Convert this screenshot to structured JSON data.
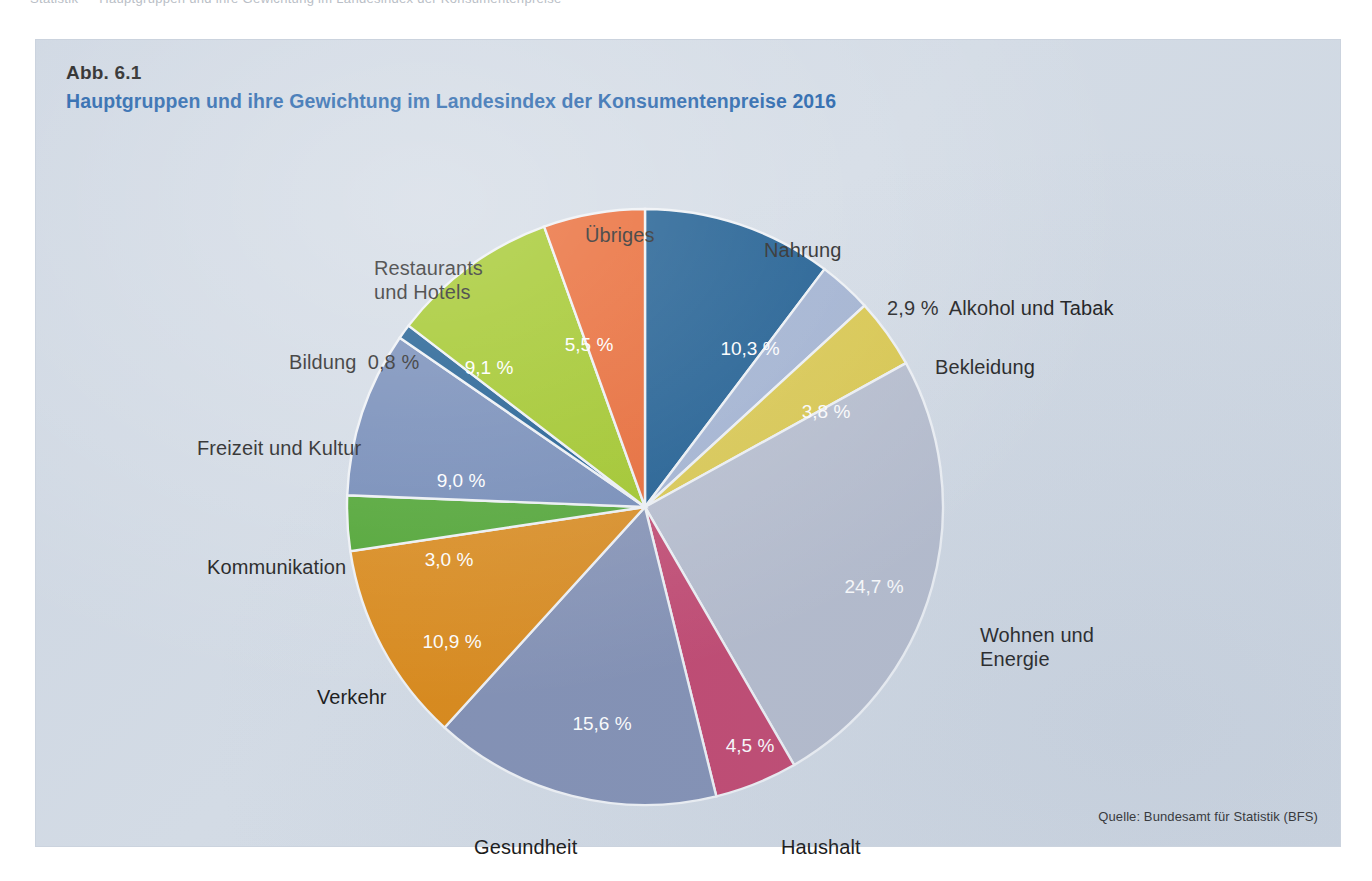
{
  "page": {
    "background_color": "#ffffff",
    "panel_color": "#ccd6e2",
    "top_artifact_text": "Statistik  — Hauptgruppen und ihre Gewichtung im Landesindex der Konsumentenpreise"
  },
  "figure": {
    "number": "Abb. 6.1",
    "title": "Hauptgruppen und ihre Gewichtung im Landesindex der Konsumentenpreise 2016",
    "title_color": "#1c5ea8",
    "source": "Quelle: Bundesamt für Statistik (BFS)"
  },
  "chart_data": {
    "type": "pie",
    "title": "Hauptgruppen und ihre Gewichtung im Landesindex der Konsumentenpreise 2016",
    "unit": "%",
    "decimal_separator": ",",
    "start_angle_deg": 0,
    "direction": "clockwise",
    "legend": "none",
    "grid": false,
    "categories": [
      "Nahrung",
      "Alkohol und Tabak",
      "Bekleidung",
      "Wohnen und Energie",
      "Haushalt",
      "Gesundheit",
      "Verkehr",
      "Kommunikation",
      "Freizeit und Kultur",
      "Bildung",
      "Restaurants und Hotels",
      "Übriges"
    ],
    "values": [
      10.3,
      2.9,
      3.8,
      24.7,
      4.5,
      15.6,
      10.9,
      3.0,
      9.0,
      0.8,
      9.1,
      5.5
    ],
    "value_labels": [
      "10,3 %",
      "2,9 %",
      "3,8 %",
      "24,7 %",
      "4,5 %",
      "15,6 %",
      "10,9 %",
      "3,0 %",
      "9,0 %",
      "0,8 %",
      "9,1 %",
      "5,5 %"
    ],
    "colors": [
      "#14568c",
      "#9fb0d0",
      "#d9c647",
      "#b5bccd",
      "#c1456e",
      "#8290b4",
      "#d9891a",
      "#4ca32f",
      "#6f87b5",
      "#14568c",
      "#9dc41e",
      "#e8622a"
    ],
    "slice_label_placement": [
      "inside",
      "outside",
      "inside",
      "inside",
      "inside",
      "inside",
      "inside",
      "inside",
      "inside",
      "outside",
      "inside",
      "inside"
    ]
  },
  "outer_labels": [
    {
      "name": "uebriges",
      "text": "Übriges",
      "x": 549,
      "y": 183,
      "align": "left"
    },
    {
      "name": "nahrung",
      "text": "Nahrung",
      "x": 728,
      "y": 198,
      "align": "left"
    },
    {
      "name": "restaurants-und-hotels",
      "text": "Restaurants\nund Hotels",
      "x": 338,
      "y": 216,
      "align": "left"
    },
    {
      "name": "alkohol-und-tabak",
      "text": "2,9 %  Alkohol und Tabak",
      "x": 851,
      "y": 256,
      "align": "left"
    },
    {
      "name": "bekleidung",
      "text": "Bekleidung",
      "x": 899,
      "y": 315,
      "align": "left"
    },
    {
      "name": "bildung",
      "text": "Bildung  0,8 %",
      "x": 253,
      "y": 310,
      "align": "left"
    },
    {
      "name": "freizeit-und-kultur",
      "text": "Freizeit und Kultur",
      "x": 161,
      "y": 396,
      "align": "left"
    },
    {
      "name": "kommunikation",
      "text": "Kommunikation",
      "x": 171,
      "y": 515,
      "align": "left"
    },
    {
      "name": "wohnen-und-energie",
      "text": "Wohnen und\nEnergie",
      "x": 944,
      "y": 583,
      "align": "left"
    },
    {
      "name": "verkehr",
      "text": "Verkehr",
      "x": 281,
      "y": 645,
      "align": "left"
    },
    {
      "name": "gesundheit",
      "text": "Gesundheit",
      "x": 438,
      "y": 795,
      "align": "left"
    },
    {
      "name": "haushalt",
      "text": "Haushalt",
      "x": 745,
      "y": 795,
      "align": "left"
    }
  ],
  "inner_value_labels": [
    {
      "name": "nahrung-value",
      "text": "10,3 %",
      "x": 714,
      "y": 315
    },
    {
      "name": "bekleidung-value",
      "text": "3,8 %",
      "x": 790,
      "y": 378
    },
    {
      "name": "wohnen-value",
      "text": "24,7 %",
      "x": 838,
      "y": 553
    },
    {
      "name": "haushalt-value",
      "text": "4,5 %",
      "x": 714,
      "y": 712
    },
    {
      "name": "gesundheit-value",
      "text": "15,6 %",
      "x": 566,
      "y": 690
    },
    {
      "name": "verkehr-value",
      "text": "10,9 %",
      "x": 416,
      "y": 608
    },
    {
      "name": "kommunikation-value",
      "text": "3,0 %",
      "x": 413,
      "y": 526
    },
    {
      "name": "freizeit-value",
      "text": "9,0 %",
      "x": 425,
      "y": 447
    },
    {
      "name": "restaurants-value",
      "text": "9,1 %",
      "x": 453,
      "y": 334
    },
    {
      "name": "uebriges-value",
      "text": "5,5 %",
      "x": 553,
      "y": 311
    }
  ]
}
